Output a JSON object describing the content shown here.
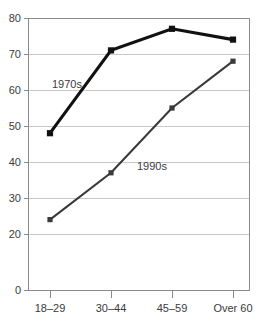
{
  "chart_data": {
    "type": "line",
    "title": "",
    "xlabel": "",
    "ylabel": "",
    "categories": [
      "18–29",
      "30–44",
      "45–59",
      "Over 60"
    ],
    "series": [
      {
        "name": "1970s",
        "values": [
          48,
          71,
          77,
          74
        ],
        "color": "#111111",
        "marker": "square"
      },
      {
        "name": "1990s",
        "values": [
          24,
          37,
          55,
          68
        ],
        "color": "#3a3a3a",
        "marker": "square"
      }
    ],
    "ylim": [
      0,
      80
    ],
    "ytick_labels": [
      "80",
      "70",
      "60",
      "50",
      "40",
      "30",
      "20",
      "0"
    ],
    "ytick_values": [
      80,
      70,
      60,
      50,
      40,
      30,
      20,
      0
    ],
    "axis_break": true,
    "axis_break_note": "y-axis compressed between 20 and 0",
    "grid": true,
    "grid_axis": "y",
    "legend": "inline-labels",
    "annotations": [
      {
        "text": "1970s",
        "series": "1970s",
        "x_px": 67,
        "y_px": 84
      },
      {
        "text": "1990s",
        "series": "1990s",
        "x_px": 152,
        "y_px": 166
      }
    ],
    "gridline_color": "#c8c8c8",
    "axis_color": "#8a8a8a",
    "background_color": "#ffffff"
  },
  "axis": {
    "y_labels": [
      {
        "text": "80",
        "y": 18
      },
      {
        "text": "70",
        "y": 54
      },
      {
        "text": "60",
        "y": 90
      },
      {
        "text": "50",
        "y": 126
      },
      {
        "text": "40",
        "y": 162
      },
      {
        "text": "30",
        "y": 198
      },
      {
        "text": "20",
        "y": 234
      },
      {
        "text": "0",
        "y": 290
      }
    ],
    "x_labels": [
      {
        "text": "18–29",
        "x": 50
      },
      {
        "text": "30–44",
        "x": 111
      },
      {
        "text": "45–59",
        "x": 172
      },
      {
        "text": "Over 60",
        "x": 233
      }
    ]
  }
}
